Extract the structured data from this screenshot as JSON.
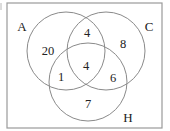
{
  "diagram": {
    "type": "venn",
    "universe_frame": {
      "x": 7,
      "y": 3,
      "width": 155,
      "height": 125
    },
    "colors": {
      "lines": "#8a8a8a",
      "frame": "#9a9a9a",
      "text": "#222222"
    },
    "sets": [
      {
        "id": "A",
        "label": "A",
        "cx": 66,
        "cy": 51,
        "r": 39,
        "label_x": 22,
        "label_y": 26
      },
      {
        "id": "C",
        "label": "C",
        "cx": 106,
        "cy": 51,
        "r": 39,
        "label_x": 149,
        "label_y": 26
      },
      {
        "id": "H",
        "label": "H",
        "cx": 88,
        "cy": 82,
        "r": 39,
        "label_x": 128,
        "label_y": 117
      }
    ],
    "regions": [
      {
        "name": "A-only",
        "value": "20",
        "x": 48,
        "y": 51
      },
      {
        "name": "A-and-C-only",
        "value": "4",
        "x": 87,
        "y": 33
      },
      {
        "name": "C-only",
        "value": "8",
        "x": 123,
        "y": 44
      },
      {
        "name": "A-and-C-and-H",
        "value": "4",
        "x": 86,
        "y": 66
      },
      {
        "name": "A-and-H-only",
        "value": "1",
        "x": 61,
        "y": 77
      },
      {
        "name": "C-and-H-only",
        "value": "6",
        "x": 113,
        "y": 78
      },
      {
        "name": "H-only",
        "value": "7",
        "x": 88,
        "y": 104
      }
    ]
  }
}
